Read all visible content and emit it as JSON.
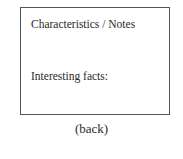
{
  "card": {
    "heading": "Characteristics / Notes",
    "facts_label": "Interesting facts:"
  },
  "caption": "(back)"
}
